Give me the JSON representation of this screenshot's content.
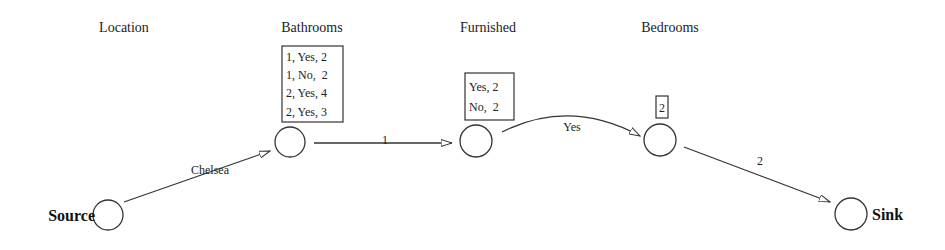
{
  "headers": {
    "location": "Location",
    "bathrooms": "Bathrooms",
    "furnished": "Furnished",
    "bedrooms": "Bedrooms"
  },
  "nodes": {
    "source": {
      "label": "Source"
    },
    "sink": {
      "label": "Sink"
    }
  },
  "boxes": {
    "bathrooms": [
      "1, Yes, 2",
      "1, No,  2",
      "2, Yes, 4",
      "2, Yes, 3"
    ],
    "furnished": [
      "Yes, 2",
      "No,  2"
    ],
    "bedrooms": [
      "2"
    ]
  },
  "edges": {
    "source_to_bathrooms": "Chelsea",
    "bathrooms_to_furnished": "1",
    "furnished_to_bedrooms": "Yes",
    "bedrooms_to_sink": "2"
  },
  "colors": {
    "stroke": "#333333",
    "text": "#222222",
    "background": "#ffffff"
  }
}
